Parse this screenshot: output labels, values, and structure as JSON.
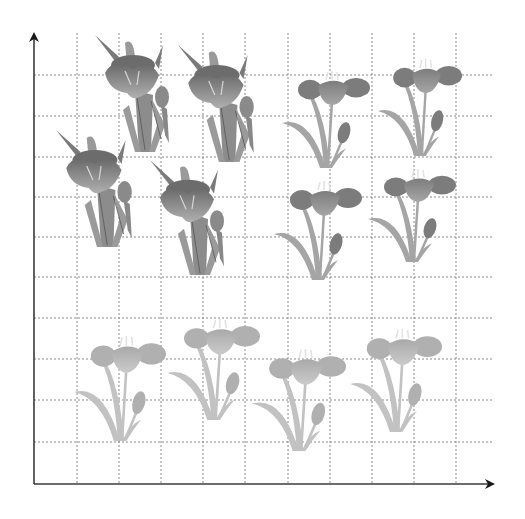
{
  "figure": {
    "type": "coordinate-grid-with-flowers",
    "axes": {
      "origin": [
        34,
        484
      ],
      "x_axis_end": 494,
      "y_axis_top": 33,
      "color": "#3a3a3a"
    },
    "grid": {
      "vertical_x": [
        77,
        119,
        161,
        203,
        245,
        288,
        330,
        372,
        414,
        456
      ],
      "horizontal_y": [
        75,
        116,
        157,
        197,
        237,
        277,
        318,
        359,
        400,
        442
      ],
      "color": "#8a8a8a"
    },
    "colors": {
      "iris_petal": "#7a7a7a",
      "iris_petal_light": "#a8a8a8",
      "iris_leaf": "#8c8c8c",
      "tulip_dark_petal": "#8a8a8a",
      "tulip_dark_leaf": "#a5a5a5",
      "tulip_light_petal": "#b5b5b5",
      "tulip_light_leaf": "#c2c2c2"
    },
    "flowers": [
      {
        "kind": "iris",
        "x": 95,
        "y": 35,
        "w": 82,
        "h": 118
      },
      {
        "kind": "iris",
        "x": 178,
        "y": 45,
        "w": 84,
        "h": 118
      },
      {
        "kind": "iris",
        "x": 56,
        "y": 130,
        "w": 84,
        "h": 118
      },
      {
        "kind": "iris",
        "x": 150,
        "y": 160,
        "w": 82,
        "h": 116
      },
      {
        "kind": "tulip-dark",
        "x": 280,
        "y": 72,
        "w": 90,
        "h": 98
      },
      {
        "kind": "tulip-dark",
        "x": 376,
        "y": 60,
        "w": 86,
        "h": 98
      },
      {
        "kind": "tulip-dark",
        "x": 272,
        "y": 182,
        "w": 90,
        "h": 100
      },
      {
        "kind": "tulip-dark",
        "x": 366,
        "y": 170,
        "w": 90,
        "h": 94
      },
      {
        "kind": "tulip-light",
        "x": 72,
        "y": 337,
        "w": 94,
        "h": 106
      },
      {
        "kind": "tulip-light",
        "x": 165,
        "y": 320,
        "w": 95,
        "h": 102
      },
      {
        "kind": "tulip-light",
        "x": 250,
        "y": 350,
        "w": 96,
        "h": 103
      },
      {
        "kind": "tulip-light",
        "x": 348,
        "y": 330,
        "w": 94,
        "h": 104
      }
    ]
  }
}
